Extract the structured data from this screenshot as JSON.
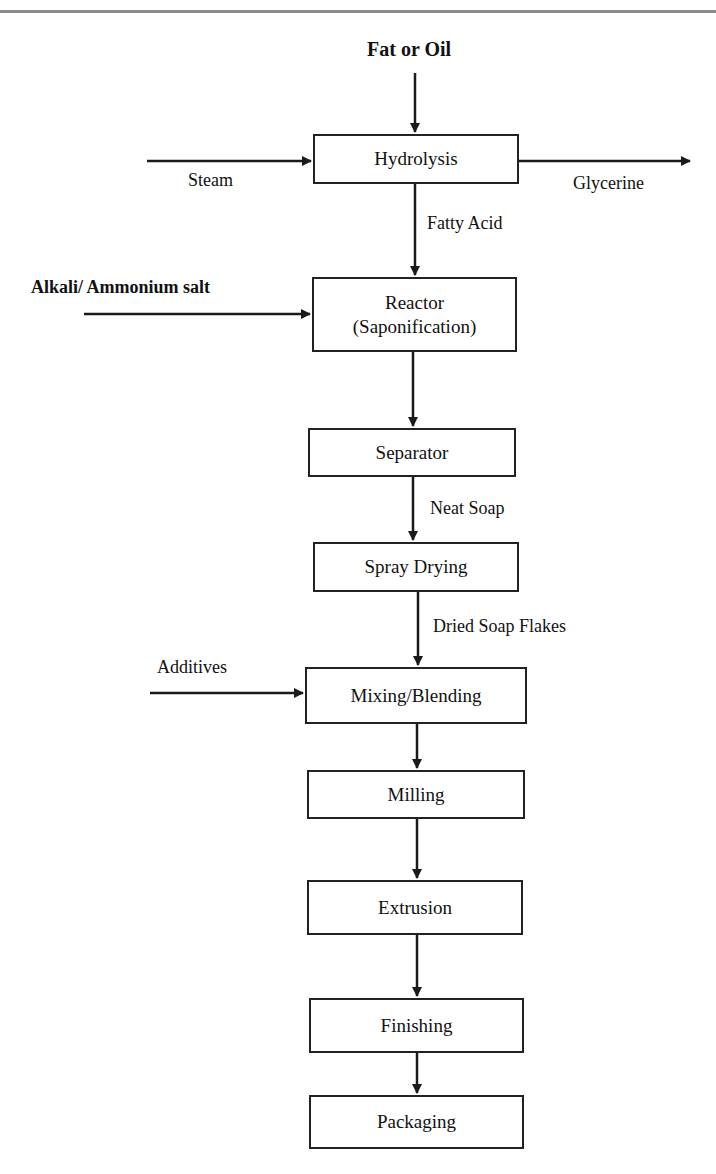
{
  "diagram": {
    "type": "process-flowchart",
    "inputs": {
      "top": "Fat or Oil",
      "steam": "Steam",
      "alkali": "Alkali/ Ammonium salt",
      "additives": "Additives"
    },
    "outputs": {
      "glycerine": "Glycerine"
    },
    "steps": [
      {
        "id": "hydrolysis",
        "line1": "Hydrolysis",
        "line2": ""
      },
      {
        "id": "reactor",
        "line1": "Reactor",
        "line2": "(Saponification)"
      },
      {
        "id": "separator",
        "line1": "Separator",
        "line2": ""
      },
      {
        "id": "spray-drying",
        "line1": "Spray Drying",
        "line2": ""
      },
      {
        "id": "mixing-blending",
        "line1": "Mixing/Blending",
        "line2": ""
      },
      {
        "id": "milling",
        "line1": "Milling",
        "line2": ""
      },
      {
        "id": "extrusion",
        "line1": "Extrusion",
        "line2": ""
      },
      {
        "id": "finishing",
        "line1": "Finishing",
        "line2": ""
      },
      {
        "id": "packaging",
        "line1": "Packaging",
        "line2": ""
      }
    ],
    "edge_labels": {
      "hydrolysis_to_reactor": "Fatty Acid",
      "separator_to_spray": "Neat Soap",
      "spray_to_mixing": "Dried Soap Flakes"
    },
    "colors": {
      "line": "#1a1a1a",
      "box_border": "#222222",
      "rule": "#8a8a8a",
      "background": "#ffffff"
    }
  }
}
